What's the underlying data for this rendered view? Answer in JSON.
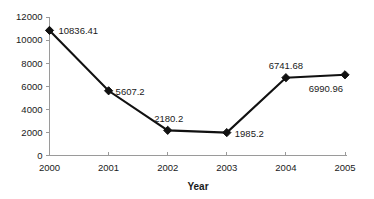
{
  "chart_data": {
    "type": "line",
    "title": "",
    "xlabel": "Year",
    "ylabel": "",
    "categories": [
      "2000",
      "2001",
      "2002",
      "2003",
      "2004",
      "2005"
    ],
    "values": [
      10836.41,
      5607.2,
      2180.2,
      1985.2,
      6741.68,
      6990.96
    ],
    "point_labels": [
      "10836.41",
      "5607.2",
      "2180.2",
      "1985.2",
      "6741.68",
      "6990.96"
    ],
    "series": [
      {
        "name": "",
        "values": [
          10836.41,
          5607.2,
          2180.2,
          1985.2,
          6741.68,
          6990.96
        ]
      }
    ],
    "ylim": [
      0,
      12000
    ],
    "ytick_values": [
      0,
      2000,
      4000,
      6000,
      8000,
      10000,
      12000
    ],
    "ytick_labels": [
      "0",
      "2000",
      "4000",
      "6000",
      "8000",
      "10000",
      "12000"
    ],
    "xtick_labels": [
      "2000",
      "2001",
      "2002",
      "2003",
      "2004",
      "2005"
    ],
    "grid": false,
    "legend": false,
    "legend_position": "none",
    "marker": "diamond",
    "colors": {
      "line": "#111111",
      "marker": "#111111",
      "axis": "#9a9a9a",
      "text": "#1a1a1a",
      "background": "#ffffff"
    }
  }
}
